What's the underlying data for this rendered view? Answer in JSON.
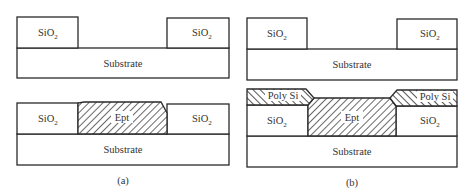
{
  "diagram": {
    "colors": {
      "stroke": "#2a2a2a",
      "text": "#333333",
      "background": "#ffffff"
    },
    "panel_a": {
      "caption": "(a)",
      "top": {
        "oxide_left": {
          "label": "SiO",
          "subscript": "2"
        },
        "oxide_right": {
          "label": "SiO",
          "subscript": "2"
        },
        "substrate": "Substrate"
      },
      "bottom": {
        "oxide_left": {
          "label": "SiO",
          "subscript": "2"
        },
        "epi": "Ept",
        "oxide_right": {
          "label": "SiO",
          "subscript": "2"
        },
        "substrate": "Substrate"
      }
    },
    "panel_b": {
      "caption": "(b)",
      "top": {
        "oxide_left": {
          "label": "SiO",
          "subscript": "2"
        },
        "oxide_right": {
          "label": "SiO",
          "subscript": "2"
        },
        "substrate": "Substrate"
      },
      "bottom": {
        "poly_left": "Poly Si",
        "poly_right": "Poly Si",
        "oxide_left": {
          "label": "SiO",
          "subscript": "2"
        },
        "epi": "Ept",
        "oxide_right": {
          "label": "SiO",
          "subscript": "2"
        },
        "substrate": "Substrate"
      }
    }
  }
}
